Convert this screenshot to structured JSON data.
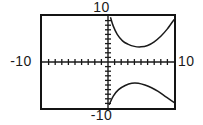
{
  "screen": {
    "title": "graphing-calculator-viewport",
    "background_color": "#ffffff",
    "frame_color": "#141414",
    "curve_color": "#1a1a1a"
  },
  "labels": {
    "y_max": "10",
    "y_min": "-10",
    "x_min": "-10",
    "x_max": "10"
  },
  "chart_data": {
    "type": "line",
    "title": "",
    "xlabel": "",
    "ylabel": "",
    "xlim": [
      -10,
      10
    ],
    "ylim": [
      -10,
      10
    ],
    "grid": false,
    "legend": "none",
    "axis_ticks": {
      "x_tick_interval": 1,
      "y_tick_interval": 1,
      "x_tick_count": 20,
      "y_tick_count": 20,
      "tick_labels_shown": [
        "-10",
        "10",
        "-10",
        "10"
      ]
    },
    "series": [
      {
        "name": "upper-branch",
        "x": [
          0.4,
          0.8,
          1.4,
          2.2,
          3.0,
          4.0,
          5.0,
          6.0,
          7.0,
          8.0,
          9.0,
          10.0
        ],
        "y": [
          9.6,
          7.8,
          6.0,
          4.6,
          3.9,
          3.4,
          3.3,
          3.6,
          4.4,
          5.6,
          7.2,
          9.2
        ]
      },
      {
        "name": "lower-branch",
        "x": [
          0.2,
          0.8,
          1.6,
          2.6,
          3.6,
          4.6,
          5.6,
          6.6,
          7.6,
          8.6,
          9.6,
          10.0
        ],
        "y": [
          -9.2,
          -7.4,
          -6.0,
          -5.1,
          -4.6,
          -4.6,
          -5.0,
          -5.6,
          -6.4,
          -7.4,
          -8.4,
          -8.8
        ]
      }
    ]
  }
}
